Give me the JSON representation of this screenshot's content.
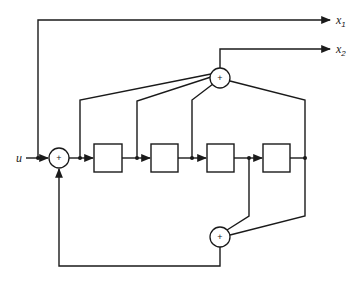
{
  "diagram": {
    "type": "convolutional-encoder-block-diagram",
    "input_label": "u",
    "outputs": [
      {
        "label": "x",
        "subscript": "1"
      },
      {
        "label": "x",
        "subscript": "2"
      }
    ],
    "adders": [
      {
        "id": "input-adder",
        "symbol": "+"
      },
      {
        "id": "upper-adder",
        "symbol": "+"
      },
      {
        "id": "lower-adder",
        "symbol": "+"
      }
    ],
    "delay_elements": [
      {
        "id": "delay-1",
        "label": ""
      },
      {
        "id": "delay-2",
        "label": ""
      },
      {
        "id": "delay-3",
        "label": ""
      },
      {
        "id": "delay-4",
        "label": ""
      }
    ],
    "colors": {
      "line": "#1a1a1a",
      "background": "#ffffff"
    }
  }
}
